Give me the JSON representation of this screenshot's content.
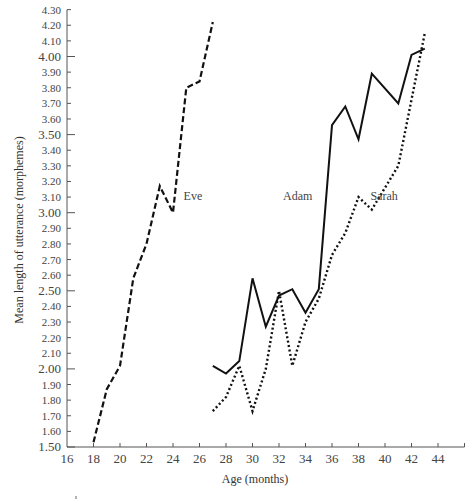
{
  "chart_data": {
    "type": "line",
    "title": "",
    "xlabel": "Age (months)",
    "ylabel": "Mean length of utterance (morphemes)",
    "xlim": [
      16,
      46
    ],
    "ylim": [
      1.5,
      4.3
    ],
    "x_ticks": [
      16,
      18,
      20,
      22,
      24,
      26,
      28,
      30,
      32,
      34,
      36,
      38,
      40,
      42,
      44
    ],
    "y_ticks": [
      "1.50",
      "1.60",
      "1.70",
      "1.80",
      "1.90",
      "2.00",
      "2.10",
      "2.20",
      "2.30",
      "2.40",
      "2.50",
      "2.60",
      "2.70",
      "2.80",
      "2.90",
      "3.00",
      "3.10",
      "3.20",
      "3.30",
      "3.40",
      "3.50",
      "3.60",
      "3.70",
      "3.80",
      "3.90",
      "4.00",
      "4.10",
      "4.20",
      "4.30"
    ],
    "y_major_ticks": [
      "1.50",
      "2.00",
      "2.50",
      "3.00",
      "3.50",
      "4.00"
    ],
    "grid": false,
    "legend": "inline labels",
    "series": [
      {
        "name": "Eve",
        "style": "dashed",
        "label_pos": {
          "x": 24.8,
          "y": 3.08
        },
        "x": [
          18,
          19,
          20,
          21,
          22,
          23,
          24,
          25,
          26,
          27
        ],
        "values": [
          1.53,
          1.87,
          2.02,
          2.58,
          2.8,
          3.17,
          3.0,
          3.8,
          3.84,
          4.22
        ]
      },
      {
        "name": "Adam",
        "style": "solid",
        "label_pos": {
          "x": 32.3,
          "y": 3.08
        },
        "x": [
          27,
          28,
          29,
          30,
          31,
          32,
          33,
          34,
          35,
          36,
          37,
          38,
          39,
          41,
          42,
          43
        ],
        "values": [
          2.02,
          1.97,
          2.05,
          2.58,
          2.27,
          2.47,
          2.51,
          2.36,
          2.51,
          3.56,
          3.68,
          3.47,
          3.89,
          3.7,
          4.01,
          4.05
        ]
      },
      {
        "name": "Sarah",
        "style": "dotted",
        "label_pos": {
          "x": 38.9,
          "y": 3.08
        },
        "x": [
          27,
          28,
          29,
          30,
          31,
          32,
          33,
          34,
          35,
          36,
          37,
          38,
          39,
          41,
          43
        ],
        "values": [
          1.73,
          1.82,
          2.02,
          1.73,
          2.0,
          2.5,
          2.02,
          2.3,
          2.45,
          2.73,
          2.87,
          3.1,
          3.02,
          3.3,
          4.15
        ]
      }
    ]
  }
}
